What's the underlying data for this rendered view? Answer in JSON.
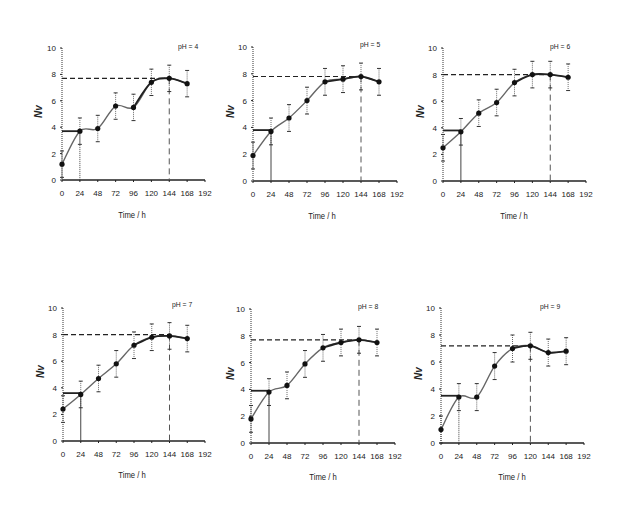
{
  "figure": {
    "x_title": "Time / h",
    "y_title": "Nv",
    "x_ticks": [
      0,
      24,
      48,
      72,
      96,
      120,
      144,
      168,
      192
    ],
    "y_ticks": [
      0,
      2,
      4,
      6,
      8,
      10
    ]
  },
  "chart_data": [
    {
      "type": "line",
      "title": "pH = 4",
      "xlabel": "Time / h",
      "ylabel": "Nv",
      "xlim": [
        0,
        192
      ],
      "ylim": [
        0,
        10
      ],
      "x": [
        0,
        24,
        48,
        72,
        96,
        120,
        144,
        168
      ],
      "series": [
        {
          "name": "Nv",
          "values": [
            1.2,
            3.7,
            3.9,
            5.6,
            5.5,
            7.4,
            7.7,
            7.3
          ],
          "error": [
            1.0,
            1.0,
            1.0,
            1.0,
            1.0,
            1.0,
            1.0,
            1.0
          ]
        }
      ],
      "annotations": {
        "lag_phase_level": 3.7,
        "lag_phase_end_time": 24,
        "max_level": 7.7,
        "max_time": 144
      },
      "grid": false,
      "legend": "none"
    },
    {
      "type": "line",
      "title": "pH = 5",
      "xlabel": "Time / h",
      "ylabel": "Nv",
      "xlim": [
        0,
        192
      ],
      "ylim": [
        0,
        10
      ],
      "x": [
        0,
        24,
        48,
        72,
        96,
        120,
        144,
        168
      ],
      "series": [
        {
          "name": "Nv",
          "values": [
            1.9,
            3.7,
            4.7,
            6.0,
            7.4,
            7.6,
            7.8,
            7.4
          ],
          "error": [
            1.0,
            1.0,
            1.0,
            1.0,
            1.0,
            1.0,
            1.0,
            1.0
          ]
        }
      ],
      "annotations": {
        "lag_phase_level": 3.8,
        "lag_phase_end_time": 24,
        "max_level": 7.8,
        "max_time": 144
      },
      "grid": false,
      "legend": "none"
    },
    {
      "type": "line",
      "title": "pH = 6",
      "xlabel": "Time / h",
      "ylabel": "Nv",
      "xlim": [
        0,
        192
      ],
      "ylim": [
        0,
        10
      ],
      "x": [
        0,
        24,
        48,
        72,
        96,
        120,
        144,
        168
      ],
      "series": [
        {
          "name": "Nv",
          "values": [
            2.5,
            3.7,
            5.1,
            5.9,
            7.4,
            8.0,
            8.0,
            7.8
          ],
          "error": [
            1.0,
            1.0,
            1.0,
            1.0,
            1.0,
            1.0,
            1.0,
            1.0
          ]
        }
      ],
      "annotations": {
        "lag_phase_level": 3.8,
        "lag_phase_end_time": 24,
        "max_level": 8.0,
        "max_time": 144
      },
      "grid": false,
      "legend": "none"
    },
    {
      "type": "line",
      "title": "pH = 7",
      "xlabel": "Time / h",
      "ylabel": "Nv",
      "xlim": [
        0,
        192
      ],
      "ylim": [
        0,
        10
      ],
      "x": [
        0,
        24,
        48,
        72,
        96,
        120,
        144,
        168
      ],
      "series": [
        {
          "name": "Nv",
          "values": [
            2.4,
            3.5,
            4.7,
            5.8,
            7.2,
            7.8,
            7.9,
            7.7
          ],
          "error": [
            1.0,
            1.0,
            1.0,
            1.0,
            1.0,
            1.0,
            1.0,
            1.0
          ]
        }
      ],
      "annotations": {
        "lag_phase_level": 3.6,
        "lag_phase_end_time": 24,
        "max_level": 8.0,
        "max_time": 144
      },
      "grid": false,
      "legend": "none"
    },
    {
      "type": "line",
      "title": "pH = 8",
      "xlabel": "Time / h",
      "ylabel": "Nv",
      "xlim": [
        0,
        192
      ],
      "ylim": [
        0,
        10
      ],
      "x": [
        0,
        24,
        48,
        72,
        96,
        120,
        144,
        168
      ],
      "series": [
        {
          "name": "Nv",
          "values": [
            1.8,
            3.8,
            4.3,
            5.9,
            7.1,
            7.5,
            7.7,
            7.5
          ],
          "error": [
            1.0,
            1.0,
            1.0,
            1.0,
            1.0,
            1.0,
            1.0,
            1.0
          ]
        }
      ],
      "annotations": {
        "lag_phase_level": 3.9,
        "lag_phase_end_time": 24,
        "max_level": 7.7,
        "max_time": 144
      },
      "grid": false,
      "legend": "none"
    },
    {
      "type": "line",
      "title": "pH = 9",
      "xlabel": "Time / h",
      "ylabel": "Nv",
      "xlim": [
        0,
        192
      ],
      "ylim": [
        0,
        10
      ],
      "x": [
        0,
        24,
        48,
        72,
        96,
        120,
        144,
        168
      ],
      "series": [
        {
          "name": "Nv",
          "values": [
            1.0,
            3.4,
            3.4,
            5.7,
            7.0,
            7.2,
            6.7,
            6.8
          ],
          "error": [
            1.0,
            1.0,
            1.0,
            1.0,
            1.0,
            1.0,
            1.0,
            1.0
          ]
        }
      ],
      "annotations": {
        "lag_phase_level": 3.5,
        "lag_phase_end_time": 24,
        "max_level": 7.2,
        "max_time": 120
      },
      "grid": false,
      "legend": "none"
    }
  ],
  "panels": [
    {
      "ph_label": "pH = 4",
      "x_title": "Time / h",
      "y_title": "Nv"
    },
    {
      "ph_label": "pH = 5",
      "x_title": "Time / h",
      "y_title": "Nv"
    },
    {
      "ph_label": "pH = 6",
      "x_title": "Time / h",
      "y_title": "Nv"
    },
    {
      "ph_label": "pH = 7",
      "x_title": "Time / h",
      "y_title": "Nv"
    },
    {
      "ph_label": "pH = 8",
      "x_title": "Time / h",
      "y_title": "Nv"
    },
    {
      "ph_label": "pH = 9",
      "x_title": "Time / h",
      "y_title": "Nv"
    }
  ]
}
